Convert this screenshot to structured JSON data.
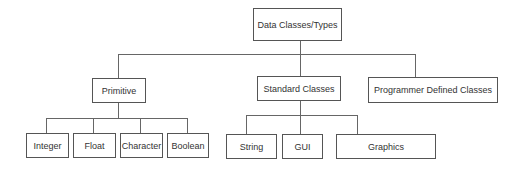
{
  "diagram": {
    "type": "hierarchy-tree",
    "root": {
      "label": "Data Classes/Types"
    },
    "level1": [
      {
        "label": "Primitive"
      },
      {
        "label": "Standard Classes"
      },
      {
        "label": "Programmer Defined Classes"
      }
    ],
    "primitive_children": [
      {
        "label": "Integer"
      },
      {
        "label": "Float"
      },
      {
        "label": "Character"
      },
      {
        "label": "Boolean"
      }
    ],
    "standard_children": [
      {
        "label": "String"
      },
      {
        "label": "GUI"
      },
      {
        "label": "Graphics"
      }
    ],
    "colors": {
      "line": "#666666",
      "border": "#555555",
      "text": "#333333",
      "background": "#ffffff"
    }
  }
}
